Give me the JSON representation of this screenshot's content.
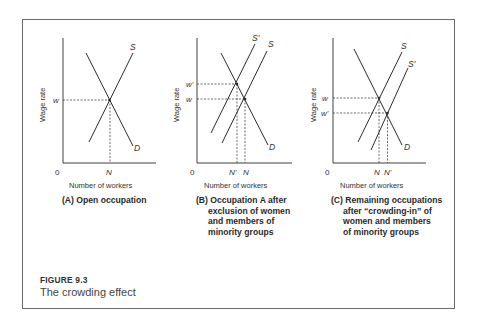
{
  "figure": {
    "number": "FIGURE 9.3",
    "title": "The crowding effect"
  },
  "panels": [
    {
      "id": "A",
      "ylabel": "Wage rate",
      "xlabel": "Number of workers",
      "origin": "0",
      "curves": {
        "supply": "S",
        "demand": "D"
      },
      "wage_labels": [
        "w"
      ],
      "qty_labels": [
        "N"
      ],
      "caption_lines": [
        "(A) Open occupation"
      ]
    },
    {
      "id": "B",
      "ylabel": "Wage rate",
      "xlabel": "Number of workers",
      "origin": "0",
      "curves": {
        "supply": "S",
        "supply_shifted": "S'",
        "demand": "D"
      },
      "wage_labels": [
        "w'",
        "w"
      ],
      "qty_labels": [
        "N'",
        "N"
      ],
      "caption_lines": [
        "(B) Occupation A after",
        "exclusion of women",
        "and members of",
        "minority groups"
      ]
    },
    {
      "id": "C",
      "ylabel": "Wage rate",
      "xlabel": "Number of workers",
      "origin": "0",
      "curves": {
        "supply": "S",
        "supply_shifted": "S'",
        "demand": "D"
      },
      "wage_labels": [
        "w",
        "w'"
      ],
      "qty_labels": [
        "N",
        "N'"
      ],
      "caption_lines": [
        "(C) Remaining occupations",
        "after “crowding-in” of",
        "women and members",
        "of minority groups"
      ]
    }
  ],
  "colors": {
    "line": "#2b2b2b",
    "frame": "#6a6a6a",
    "text": "#333333"
  }
}
